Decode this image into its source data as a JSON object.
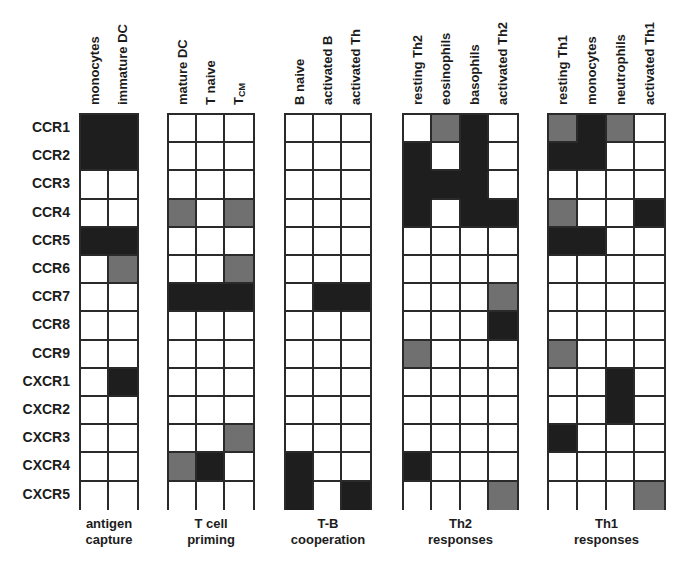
{
  "rows": [
    "CCR1",
    "CCR2",
    "CCR3",
    "CCR4",
    "CCR5",
    "CCR6",
    "CCR7",
    "CCR8",
    "CCR9",
    "CXCR1",
    "CXCR2",
    "CXCR3",
    "CXCR4",
    "CXCR5"
  ],
  "legend_levels": {
    "0": "none (white)",
    "1": "intermediate (grey)",
    "2": "high (black)"
  },
  "colors": {
    "none": "#ffffff",
    "intermediate": "#707070",
    "high": "#1e1e1e",
    "grid": "#2a2a2a"
  },
  "groups": [
    {
      "label": "antigen\ncapture",
      "columns": [
        "monocytes",
        "immature DC"
      ],
      "matrix": [
        [
          2,
          2
        ],
        [
          2,
          2
        ],
        [
          0,
          0
        ],
        [
          0,
          0
        ],
        [
          2,
          2
        ],
        [
          0,
          1
        ],
        [
          0,
          0
        ],
        [
          0,
          0
        ],
        [
          0,
          0
        ],
        [
          0,
          2
        ],
        [
          0,
          0
        ],
        [
          0,
          0
        ],
        [
          0,
          0
        ],
        [
          0,
          0
        ]
      ]
    },
    {
      "label": "T cell\npriming",
      "columns": [
        "mature DC",
        "T naive",
        "T_CM"
      ],
      "matrix": [
        [
          0,
          0,
          0
        ],
        [
          0,
          0,
          0
        ],
        [
          0,
          0,
          0
        ],
        [
          1,
          0,
          1
        ],
        [
          0,
          0,
          0
        ],
        [
          0,
          0,
          1
        ],
        [
          2,
          2,
          2
        ],
        [
          0,
          0,
          0
        ],
        [
          0,
          0,
          0
        ],
        [
          0,
          0,
          0
        ],
        [
          0,
          0,
          0
        ],
        [
          0,
          0,
          1
        ],
        [
          1,
          2,
          0
        ],
        [
          0,
          0,
          0
        ]
      ]
    },
    {
      "label": "T-B\ncooperation",
      "columns": [
        "B naive",
        "activated B",
        "activated Th"
      ],
      "matrix": [
        [
          0,
          0,
          0
        ],
        [
          0,
          0,
          0
        ],
        [
          0,
          0,
          0
        ],
        [
          0,
          0,
          0
        ],
        [
          0,
          0,
          0
        ],
        [
          0,
          0,
          0
        ],
        [
          0,
          2,
          2
        ],
        [
          0,
          0,
          0
        ],
        [
          0,
          0,
          0
        ],
        [
          0,
          0,
          0
        ],
        [
          0,
          0,
          0
        ],
        [
          0,
          0,
          0
        ],
        [
          2,
          0,
          0
        ],
        [
          2,
          0,
          2
        ]
      ]
    },
    {
      "label": "Th2\nresponses",
      "columns": [
        "resting Th2",
        "eosinophils",
        "basophils",
        "activated Th2"
      ],
      "matrix": [
        [
          0,
          1,
          2,
          0
        ],
        [
          2,
          0,
          2,
          0
        ],
        [
          2,
          2,
          2,
          0
        ],
        [
          2,
          0,
          2,
          2
        ],
        [
          0,
          0,
          0,
          0
        ],
        [
          0,
          0,
          0,
          0
        ],
        [
          0,
          0,
          0,
          1
        ],
        [
          0,
          0,
          0,
          2
        ],
        [
          1,
          0,
          0,
          0
        ],
        [
          0,
          0,
          0,
          0
        ],
        [
          0,
          0,
          0,
          0
        ],
        [
          0,
          0,
          0,
          0
        ],
        [
          2,
          0,
          0,
          0
        ],
        [
          0,
          0,
          0,
          1
        ]
      ]
    },
    {
      "label": "Th1\nresponses",
      "columns": [
        "resting Th1",
        "monocytes",
        "neutrophils",
        "activated Th1"
      ],
      "matrix": [
        [
          1,
          2,
          1,
          0
        ],
        [
          2,
          2,
          0,
          0
        ],
        [
          0,
          0,
          0,
          0
        ],
        [
          1,
          0,
          0,
          2
        ],
        [
          2,
          2,
          0,
          0
        ],
        [
          0,
          0,
          0,
          0
        ],
        [
          0,
          0,
          0,
          0
        ],
        [
          0,
          0,
          0,
          0
        ],
        [
          1,
          0,
          0,
          0
        ],
        [
          0,
          0,
          2,
          0
        ],
        [
          0,
          0,
          2,
          0
        ],
        [
          2,
          0,
          0,
          0
        ],
        [
          0,
          0,
          0,
          0
        ],
        [
          0,
          0,
          0,
          1
        ]
      ]
    }
  ],
  "layout": {
    "grid_top": 113,
    "row_height": 28.2,
    "block_x": [
      79,
      167,
      284,
      402,
      547
    ],
    "block_w": [
      58,
      86,
      86,
      115,
      117
    ]
  }
}
